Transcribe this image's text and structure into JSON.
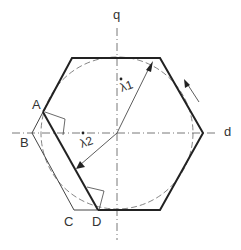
{
  "diagram": {
    "axes": {
      "vertical": "q",
      "horizontal": "d"
    },
    "points": {
      "A": "A",
      "B": "B",
      "C": "C",
      "D": "D"
    },
    "vectors": {
      "lambda1": "λ1",
      "lambda2": "λ2"
    },
    "colors": {
      "line": "#222222",
      "thin": "#444444",
      "background": "#ffffff"
    }
  }
}
